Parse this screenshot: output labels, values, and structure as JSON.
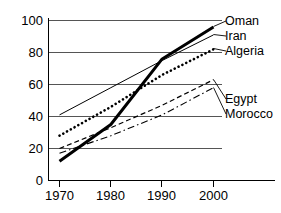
{
  "chart_data": {
    "type": "line",
    "title": "",
    "subtitle": "",
    "xlabel": "",
    "ylabel": "",
    "x": [
      1970,
      1980,
      1990,
      2000
    ],
    "xlim": [
      1968,
      2003
    ],
    "ylim": [
      0,
      100
    ],
    "xticks": [
      "1970",
      "1980",
      "1990",
      "2000"
    ],
    "yticks": [
      "0",
      "20",
      "40",
      "60",
      "80",
      "100"
    ],
    "grid": "horizontal",
    "legend_position": "right-inline-labels",
    "series": [
      {
        "name": "Oman",
        "label": "Oman",
        "style": "thick-solid",
        "color": "#000000",
        "x": [
          1970,
          1980,
          1990,
          2000
        ],
        "values": [
          12,
          35,
          76,
          96
        ]
      },
      {
        "name": "Iran",
        "label": "Iran",
        "style": "thin-solid",
        "color": "#000000",
        "x": [
          1970,
          1980,
          1990,
          2000
        ],
        "values": [
          41,
          58,
          75,
          91
        ]
      },
      {
        "name": "Algeria",
        "label": "Algeria",
        "style": "dotted",
        "color": "#000000",
        "x": [
          1970,
          1980,
          1990,
          2000
        ],
        "values": [
          28,
          46,
          66,
          82
        ]
      },
      {
        "name": "Egypt",
        "label": "Egypt",
        "style": "dashed",
        "color": "#000000",
        "x": [
          1970,
          1980,
          1990,
          2000
        ],
        "values": [
          20,
          33,
          47,
          63
        ]
      },
      {
        "name": "Morocco",
        "label": "Morocco",
        "style": "dash-dot",
        "color": "#000000",
        "x": [
          1970,
          1980,
          1990,
          2000
        ],
        "values": [
          17,
          28,
          41,
          58
        ]
      }
    ]
  },
  "axes": {
    "y_tick_0": "0",
    "y_tick_20": "20",
    "y_tick_40": "40",
    "y_tick_60": "60",
    "y_tick_80": "80",
    "y_tick_100": "100",
    "x_tick_1970": "1970",
    "x_tick_1980": "1980",
    "x_tick_1990": "1990",
    "x_tick_2000": "2000"
  },
  "labels": {
    "oman": "Oman",
    "iran": "Iran",
    "algeria": "Algeria",
    "egypt": "Egypt",
    "morocco": "Morocco"
  }
}
